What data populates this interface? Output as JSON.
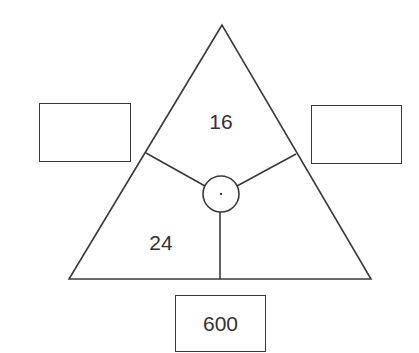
{
  "diagram": {
    "type": "triangle-number-puzzle",
    "triangle": {
      "apex": [
        222,
        25
      ],
      "base_left": [
        69,
        279
      ],
      "base_right": [
        371,
        279
      ],
      "stroke": "#3a3a3a"
    },
    "center_circle": {
      "cx": 221,
      "cy": 194,
      "r": 18
    },
    "sections": [
      {
        "position": "top",
        "value": "16"
      },
      {
        "position": "bottom-left",
        "value": "24"
      },
      {
        "position": "bottom-right",
        "value": ""
      }
    ],
    "outer_boxes": [
      {
        "position": "left",
        "value": ""
      },
      {
        "position": "right",
        "value": ""
      },
      {
        "position": "bottom",
        "value": "600"
      }
    ]
  }
}
